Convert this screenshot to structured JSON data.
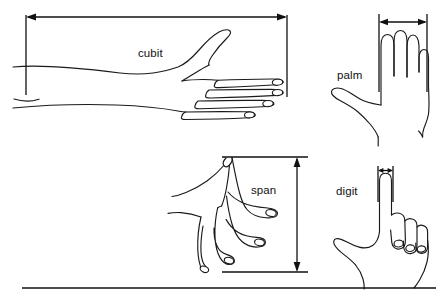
{
  "figure": {
    "background_color": "#ffffff",
    "ink_color": "#1a1a1a",
    "width": 444,
    "height": 301,
    "baseline_rule": {
      "name": "bottom-rule",
      "x1": 22,
      "x2": 436,
      "y": 288
    }
  },
  "panels": [
    {
      "id": "cubit",
      "label": "cubit",
      "label_x": 138,
      "label_y": 47,
      "subject": "forearm-and-open-hand",
      "measure": "elbow to fingertip",
      "dimension": {
        "name": "cubit-dimension-arrow",
        "orientation": "horizontal",
        "double_headed": true,
        "x1": 26,
        "x2": 287,
        "y": 17,
        "extension_lines": [
          {
            "x": 26,
            "y1": 17,
            "y2": 95
          },
          {
            "x": 287,
            "y1": 17,
            "y2": 95
          }
        ]
      }
    },
    {
      "id": "palm",
      "label": "palm",
      "label_x": 337,
      "label_y": 69,
      "subject": "hand-fingers-together-back-view",
      "measure": "width across four fingers",
      "dimension": {
        "name": "palm-dimension-arrow",
        "orientation": "horizontal",
        "double_headed": true,
        "x1": 379,
        "x2": 427,
        "y": 22,
        "extension_lines": [
          {
            "x": 379,
            "y1": 14,
            "y2": 92
          },
          {
            "x": 427,
            "y1": 14,
            "y2": 92
          }
        ]
      }
    },
    {
      "id": "span",
      "label": "span",
      "label_x": 251,
      "label_y": 184,
      "subject": "hand-fingers-spread",
      "measure": "thumb tip to little-finger tip",
      "dimension": {
        "name": "span-dimension-arrow",
        "orientation": "vertical",
        "double_headed": true,
        "y1": 157,
        "y2": 272,
        "x": 297,
        "extension_lines": [
          {
            "y": 157,
            "x1": 222,
            "x2": 308
          },
          {
            "y": 272,
            "x1": 222,
            "x2": 308
          }
        ]
      }
    },
    {
      "id": "digit",
      "label": "digit",
      "label_x": 336,
      "label_y": 185,
      "subject": "fist-with-index-finger-extended",
      "measure": "width of one finger",
      "dimension": {
        "name": "digit-dimension-arrow",
        "orientation": "horizontal",
        "double_headed": true,
        "x1": 378,
        "x2": 393,
        "y": 170,
        "extension_lines": [
          {
            "x": 378,
            "y1": 166,
            "y2": 200
          },
          {
            "x": 393,
            "y1": 166,
            "y2": 200
          }
        ]
      }
    }
  ]
}
